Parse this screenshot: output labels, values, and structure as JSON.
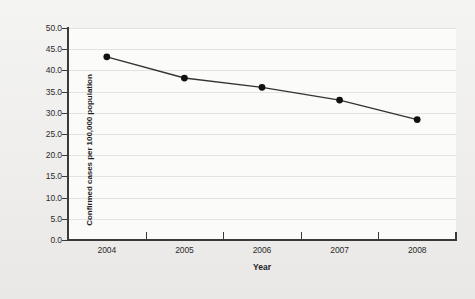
{
  "chart_data": {
    "type": "line",
    "title": "",
    "xlabel": "Year",
    "ylabel": "Confirmed cases per 100,000 population",
    "categories": [
      "2004",
      "2005",
      "2006",
      "2007",
      "2008"
    ],
    "values": [
      43.2,
      38.2,
      36.0,
      33.0,
      28.4
    ],
    "series": [
      {
        "name": "Confirmed cases per 100,000 population",
        "values": [
          43.2,
          38.2,
          36.0,
          33.0,
          28.4
        ]
      }
    ],
    "ylim": [
      0.0,
      50.0
    ],
    "ytick_labels": [
      "0.0",
      "5.0",
      "10.0",
      "15.0",
      "20.0",
      "25.0",
      "30.0",
      "35.0",
      "40.0",
      "45.0",
      "50.0"
    ],
    "ytick_values": [
      0.0,
      5.0,
      10.0,
      15.0,
      20.0,
      25.0,
      30.0,
      35.0,
      40.0,
      45.0,
      50.0
    ],
    "xtick_labels": [
      "2004",
      "2005",
      "2006",
      "2007",
      "2008"
    ],
    "grid": "horizontal",
    "legend": "none",
    "marker": "filled-circle",
    "line_color": "#333333",
    "marker_color": "#111111",
    "gridline_color": "#e3e3e1",
    "axis_color": "#3a3a3a",
    "plot_background": "#fbfbfa",
    "figure_background": "#f1f1ef"
  }
}
